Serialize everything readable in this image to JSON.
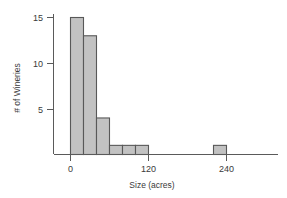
{
  "chart_data": {
    "type": "bar",
    "title": "",
    "subtitle": "",
    "xlabel": "Size (acres)",
    "ylabel": "# of Wineries",
    "grid": false,
    "legend": null,
    "xlim": [
      -20,
      280
    ],
    "ylim": [
      0,
      16
    ],
    "bin_width": 20,
    "x_ticks": [
      0,
      120,
      240
    ],
    "x_tick_labels": [
      "0",
      "120",
      "240"
    ],
    "y_ticks": [
      5,
      10,
      15
    ],
    "y_tick_labels": [
      "5",
      "10",
      "15"
    ],
    "bins": [
      {
        "x0": 0,
        "x1": 20,
        "count": 15
      },
      {
        "x0": 20,
        "x1": 40,
        "count": 13
      },
      {
        "x0": 40,
        "x1": 60,
        "count": 4
      },
      {
        "x0": 60,
        "x1": 80,
        "count": 1
      },
      {
        "x0": 80,
        "x1": 100,
        "count": 1
      },
      {
        "x0": 100,
        "x1": 120,
        "count": 1
      },
      {
        "x0": 120,
        "x1": 140,
        "count": 0
      },
      {
        "x0": 140,
        "x1": 160,
        "count": 0
      },
      {
        "x0": 160,
        "x1": 180,
        "count": 0
      },
      {
        "x0": 180,
        "x1": 200,
        "count": 0
      },
      {
        "x0": 200,
        "x1": 220,
        "count": 0
      },
      {
        "x0": 220,
        "x1": 240,
        "count": 1
      }
    ],
    "categories": [
      "0-20",
      "20-40",
      "40-60",
      "60-80",
      "80-100",
      "100-120",
      "120-140",
      "140-160",
      "160-180",
      "180-200",
      "200-220",
      "220-240"
    ],
    "values": [
      15,
      13,
      4,
      1,
      1,
      1,
      0,
      0,
      0,
      0,
      0,
      1
    ]
  },
  "colors": {
    "bar_fill": "#c2c2c2",
    "bar_stroke": "#585858",
    "axis": "#5a5a5a",
    "text": "#3a3a3a",
    "background": "#ffffff"
  }
}
